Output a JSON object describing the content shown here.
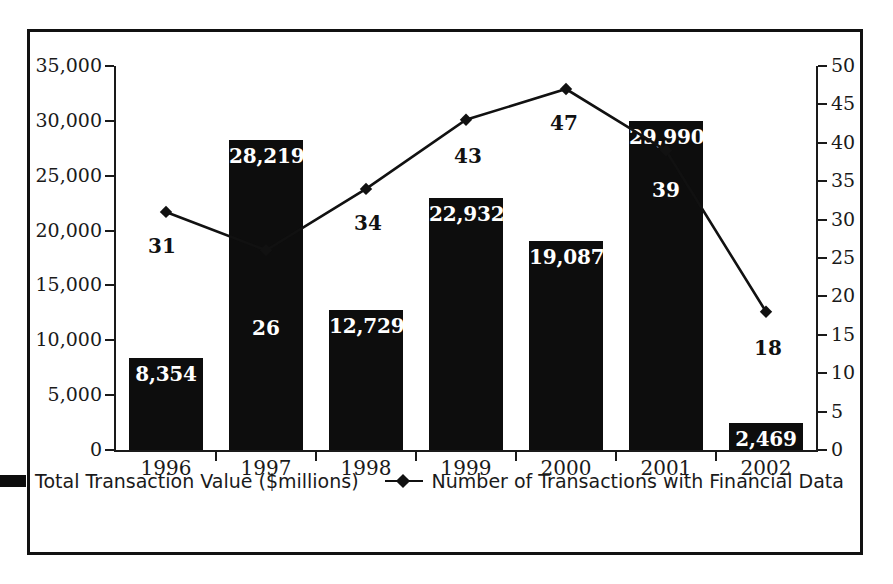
{
  "chart_data": {
    "type": "bar",
    "title": "",
    "subtitle": "",
    "xlabel": "",
    "ylabel": "",
    "grid": false,
    "legend_position": "bottom",
    "categories": [
      "1996",
      "1997",
      "1998",
      "1999",
      "2000",
      "2001",
      "2002"
    ],
    "series": [
      {
        "name": "Total Transaction Value ($millions)",
        "type": "bar",
        "axis": "left",
        "color": "#0d0d0d",
        "values": [
          8354,
          28219,
          12729,
          22932,
          19087,
          29990,
          2469
        ],
        "value_labels": [
          "8,354",
          "28,219",
          "12,729",
          "22,932",
          "19,087",
          "29,990",
          "2,469"
        ]
      },
      {
        "name": "Number of Transactions with Financial Data",
        "type": "line",
        "axis": "right",
        "color": "#111111",
        "marker": "diamond",
        "values": [
          31,
          26,
          34,
          43,
          47,
          39,
          18
        ],
        "value_labels": [
          "31",
          "26",
          "34",
          "43",
          "47",
          "39",
          "18"
        ]
      }
    ],
    "left_axis": {
      "label": "",
      "min": 0,
      "max": 35000,
      "step": 5000,
      "ticks": [
        "0",
        "5,000",
        "10,000",
        "15,000",
        "20,000",
        "25,000",
        "30,000",
        "35,000"
      ]
    },
    "right_axis": {
      "label": "",
      "min": 0,
      "max": 50,
      "step": 5,
      "ticks": [
        "0",
        "5",
        "10",
        "15",
        "20",
        "25",
        "30",
        "35",
        "40",
        "45",
        "50"
      ]
    }
  },
  "legend": {
    "items": [
      {
        "label": "Total Transaction Value ($millions)",
        "marker": "bar-swatch"
      },
      {
        "label": "Number of Transactions with Financial Data",
        "marker": "line-diamond-swatch"
      }
    ]
  },
  "colors": {
    "bar": "#0d0d0d",
    "line": "#111111",
    "axis": "#1a1a1a",
    "frame": "#111111",
    "background": "#ffffff",
    "bar_label_text": "#ffffff"
  }
}
